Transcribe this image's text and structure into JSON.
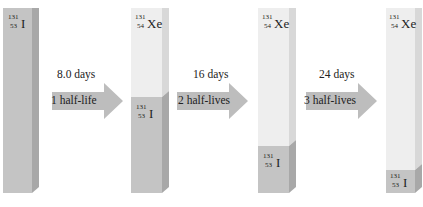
{
  "nuclides": {
    "iodine": {
      "mass": "131",
      "atomic": "53",
      "symbol": "I"
    },
    "xenon": {
      "mass": "131",
      "atomic": "54",
      "symbol": "Xe"
    }
  },
  "colors": {
    "iodine": "#c4c4c4",
    "xenon": "#eeeeee",
    "arrow": "#bdbdbd"
  },
  "bars": [
    {
      "label": "start",
      "iodine_fraction": 1.0
    },
    {
      "label": "after 1 half-life",
      "iodine_fraction": 0.5
    },
    {
      "label": "after 2 half-lives",
      "iodine_fraction": 0.25
    },
    {
      "label": "after 3 half-lives",
      "iodine_fraction": 0.125
    }
  ],
  "arrows": [
    {
      "time": "8.0 days",
      "halflives": "1 half-life"
    },
    {
      "time": "16 days",
      "halflives": "2 half-lives"
    },
    {
      "time": "24 days",
      "halflives": "3 half-lives"
    }
  ]
}
